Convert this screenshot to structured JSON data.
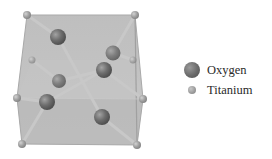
{
  "figure": {
    "colors": {
      "cell_face": "#b9b9b9",
      "cell_edge": "#a8a8a8",
      "bond": "#c4c4c4",
      "oxygen": "#707070",
      "titanium": "#a6a6a6"
    },
    "titanium_atoms": [
      {
        "x": 27,
        "y": 15
      },
      {
        "x": 135,
        "y": 15
      },
      {
        "x": 17,
        "y": 98
      },
      {
        "x": 143,
        "y": 99
      },
      {
        "x": 22,
        "y": 144
      },
      {
        "x": 137,
        "y": 145
      },
      {
        "x": 32,
        "y": 60
      },
      {
        "x": 133,
        "y": 60
      }
    ],
    "oxygen_atoms": [
      {
        "x": 58,
        "y": 37
      },
      {
        "x": 113,
        "y": 53
      },
      {
        "x": 104,
        "y": 70
      },
      {
        "x": 59,
        "y": 81
      },
      {
        "x": 47,
        "y": 102
      },
      {
        "x": 102,
        "y": 117
      }
    ]
  },
  "legend": {
    "items": [
      {
        "label": "Oxygen",
        "symbol": "oxygen-ball"
      },
      {
        "label": "Titanium",
        "symbol": "titanium-ball"
      }
    ]
  }
}
